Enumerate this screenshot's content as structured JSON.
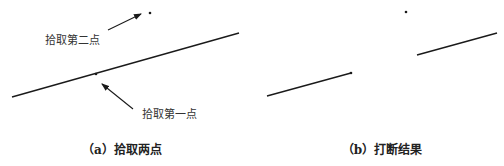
{
  "panel_a": {
    "caption": "（a）拾取两点",
    "label_second_point": "拾取第二点",
    "label_first_point": "拾取第一点",
    "line": {
      "x1": 12,
      "y1": 97,
      "x2": 239,
      "y2": 33
    },
    "first_point": {
      "x": 96,
      "y": 74
    },
    "second_point": {
      "x": 150,
      "y": 13
    },
    "arrow_second": {
      "from": [
        108,
        30
      ],
      "to": [
        142,
        13
      ]
    },
    "arrow_first": {
      "from": [
        133,
        109
      ],
      "to": [
        101,
        84
      ]
    }
  },
  "panel_b": {
    "caption": "（b）打断结果",
    "segment_left": {
      "x1": 267,
      "y1": 96,
      "x2": 351,
      "y2": 73
    },
    "segment_right": {
      "x1": 417,
      "y1": 55,
      "x2": 497,
      "y2": 33
    },
    "endpoint_dot": {
      "x": 351,
      "y": 73
    },
    "isolated_dot": {
      "x": 406,
      "y": 12
    }
  },
  "colors": {
    "line": "#1a1a1a",
    "text": "#333333"
  }
}
